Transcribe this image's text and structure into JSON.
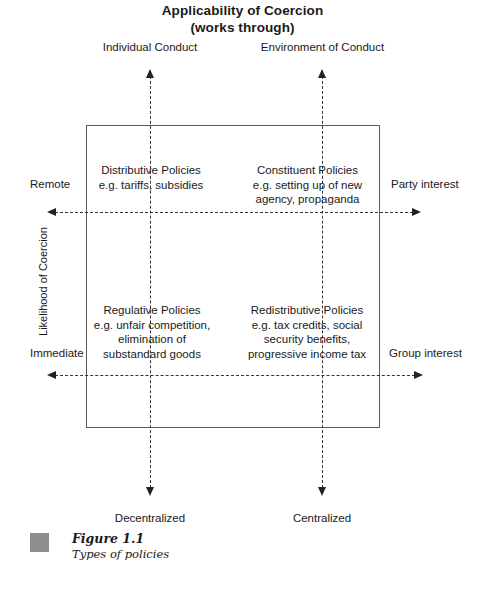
{
  "chart_data": {
    "type": "diagram",
    "diagram_kind": "2x2-matrix",
    "title": "Applicability of Coercion\n(works through)",
    "title_lines": [
      "Applicability of Coercion",
      "(works through)"
    ],
    "x_axis": {
      "top_labels": [
        "Individual Conduct",
        "Environment of Conduct"
      ],
      "bottom_labels": [
        "Decentralized",
        "Centralized"
      ]
    },
    "y_axis": {
      "title": "Likelihood of Coercion",
      "left_labels": [
        "Remote",
        "Immediate"
      ],
      "right_labels": [
        "Party interest",
        "Group interest"
      ]
    },
    "quadrants": [
      {
        "position": "top-left",
        "title": "Distributive Policies",
        "examples": "e.g. tariffs, subsidies",
        "example_lines": [
          "e.g. tariffs, subsidies"
        ]
      },
      {
        "position": "top-right",
        "title": "Constituent Policies",
        "examples": "e.g. setting up of new agency, propaganda",
        "example_lines": [
          "e.g. setting up of new",
          "agency, propaganda"
        ]
      },
      {
        "position": "bottom-left",
        "title": "Regulative Policies",
        "examples": "e.g. unfair competition, elimination of substandard goods",
        "example_lines": [
          "e.g. unfair competition,",
          "elimination of",
          "substandard goods"
        ]
      },
      {
        "position": "bottom-right",
        "title": "Redistributive Policies",
        "examples": "e.g. tax credits, social security benefits, progressive income tax",
        "example_lines": [
          "e.g. tax credits, social",
          "security benefits,",
          "progressive income tax"
        ]
      }
    ],
    "colors": {
      "box_border": "#5a5a5a",
      "dashed_line": "#333333",
      "arrow": "#222222",
      "caption_swatch": "#8d8d8d",
      "text": "#1a1a1a",
      "background": "#ffffff"
    }
  },
  "title": {
    "line1": "Applicability of Coercion",
    "line2": "(works through)"
  },
  "headers": {
    "individual_conduct": "Individual Conduct",
    "environment_of_conduct": "Environment of Conduct"
  },
  "quadrants": {
    "top_left": {
      "title": "Distributive Policies",
      "line1": "e.g. tariffs, subsidies",
      "line2": "",
      "line3": ""
    },
    "top_right": {
      "title": "Constituent Policies",
      "line1": "e.g. setting up of new",
      "line2": "agency, propaganda",
      "line3": ""
    },
    "bottom_left": {
      "title": "Regulative Policies",
      "line1": "e.g. unfair competition,",
      "line2": "elimination of",
      "line3": "substandard goods"
    },
    "bottom_right": {
      "title": "Redistributive Policies",
      "line1": "e.g. tax credits, social",
      "line2": "security benefits,",
      "line3": "progressive income tax"
    }
  },
  "side_labels": {
    "remote": "Remote",
    "immediate": "Immediate",
    "party_interest": "Party interest",
    "group_interest": "Group interest",
    "y_axis_title": "Likelihood of Coercion"
  },
  "bottom_labels": {
    "decentralized": "Decentralized",
    "centralized": "Centralized"
  },
  "caption": {
    "figure_number": "Figure 1.1",
    "figure_title": "Types of policies"
  }
}
